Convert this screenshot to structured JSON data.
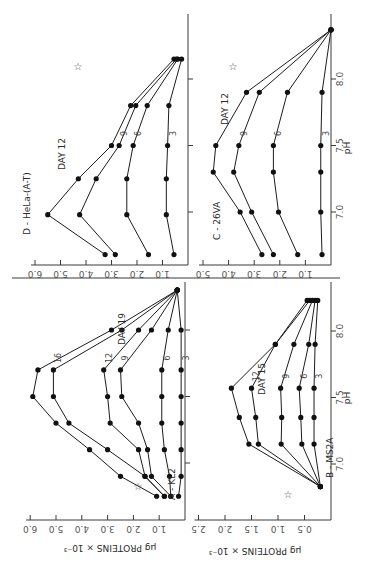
{
  "figure": {
    "orientation": "rotated 90 degrees clockwise",
    "xlabel": "pH",
    "ylabel": "µg PROTEINS × 10⁻³",
    "star_marker": "☆"
  },
  "chart_data": [
    {
      "type": "line",
      "panel": "A",
      "title": "A - KL2",
      "annotation": "DAY 19",
      "xlabel": "pH",
      "ylabel": "µg PROTEINS × 10⁻³",
      "xticks": [
        "7.0",
        "7.5",
        "8.0"
      ],
      "yticks": [
        "1.0",
        "2.0",
        "3.0",
        "4.0",
        "5.0",
        "6.0"
      ],
      "ylim": [
        0,
        6.0
      ],
      "series": [
        {
          "name": "19",
          "x": [
            6.75,
            6.9,
            7.1,
            7.3,
            7.5,
            7.7,
            8.0,
            8.3
          ],
          "values": [
            1.1,
            2.5,
            3.7,
            5.0,
            5.9,
            5.7,
            2.85,
            0.3
          ]
        },
        {
          "name": "16",
          "x": [
            6.75,
            6.9,
            7.1,
            7.3,
            7.5,
            7.7,
            8.0,
            8.3
          ],
          "values": [
            0.8,
            1.55,
            3.0,
            4.5,
            5.1,
            5.1,
            2.45,
            0.3
          ]
        },
        {
          "name": "12",
          "x": [
            6.75,
            6.9,
            7.1,
            7.3,
            7.5,
            7.7,
            8.0,
            8.3
          ],
          "values": [
            0.8,
            1.55,
            1.8,
            2.9,
            3.0,
            3.15,
            1.8,
            0.3
          ]
        },
        {
          "name": "9",
          "x": [
            6.75,
            6.9,
            7.1,
            7.3,
            7.5,
            7.7,
            8.0,
            8.3
          ],
          "values": [
            0.55,
            1.3,
            1.45,
            1.8,
            2.45,
            2.5,
            1.3,
            0.3
          ]
        },
        {
          "name": "6",
          "x": [
            6.75,
            6.9,
            7.1,
            7.3,
            7.5,
            7.7,
            8.0,
            8.3
          ],
          "values": [
            0.55,
            0.6,
            0.8,
            0.9,
            0.9,
            0.9,
            0.65,
            0.3
          ]
        },
        {
          "name": "3",
          "x": [
            6.75,
            6.9,
            7.1,
            7.3,
            7.5,
            7.7,
            8.0,
            8.3
          ],
          "values": [
            0.25,
            0.15,
            0.15,
            0.15,
            0.15,
            0.15,
            0.15,
            0.3
          ]
        }
      ]
    },
    {
      "type": "line",
      "panel": "B",
      "title": "B - MS2A",
      "annotation": "DAY 15",
      "xlabel": "pH",
      "ylabel": "µg PROTEINS × 10⁻³",
      "xticks": [
        "7.0",
        "7.5",
        "8.0"
      ],
      "yticks": [
        "0.5",
        "1.0",
        "1.5",
        "2.0",
        "2.5"
      ],
      "ylim": [
        0,
        2.5
      ],
      "series": [
        {
          "name": "15",
          "x": [
            6.83,
            7.15,
            7.35,
            7.57,
            7.9,
            8.23
          ],
          "values": [
            0.2,
            1.55,
            1.73,
            1.88,
            1.05,
            0.45
          ]
        },
        {
          "name": "12",
          "x": [
            6.83,
            7.15,
            7.35,
            7.57,
            7.9,
            8.23
          ],
          "values": [
            0.2,
            1.37,
            1.42,
            1.5,
            1.05,
            0.4
          ]
        },
        {
          "name": "9",
          "x": [
            6.83,
            7.15,
            7.35,
            7.57,
            7.9,
            8.23
          ],
          "values": [
            0.2,
            0.94,
            0.93,
            0.95,
            0.7,
            0.35
          ]
        },
        {
          "name": "6",
          "x": [
            6.83,
            7.15,
            7.35,
            7.57,
            7.9,
            8.23
          ],
          "values": [
            0.2,
            0.55,
            0.57,
            0.6,
            0.42,
            0.3
          ]
        },
        {
          "name": "3",
          "x": [
            6.83,
            7.15,
            7.35,
            7.57,
            7.9,
            8.23
          ],
          "values": [
            0.2,
            0.32,
            0.32,
            0.32,
            0.3,
            0.25
          ]
        }
      ]
    },
    {
      "type": "line",
      "panel": "C",
      "title": "C - 26VA",
      "annotation": "DAY 12",
      "xlabel": "pH",
      "ylabel": "µg PROTEINS × 10⁻³",
      "xticks": [
        "7.0",
        "7.5",
        "8.0"
      ],
      "yticks": [
        "1.0",
        "2.0",
        "3.0",
        "4.0",
        "5.0"
      ],
      "ylim": [
        0,
        5.0
      ],
      "series": [
        {
          "name": "12",
          "x": [
            6.68,
            7.0,
            7.3,
            7.5,
            7.9,
            8.37
          ],
          "values": [
            2.7,
            3.55,
            4.6,
            4.5,
            3.3,
            0.0
          ]
        },
        {
          "name": "9",
          "x": [
            6.68,
            7.0,
            7.3,
            7.5,
            7.9,
            8.37
          ],
          "values": [
            2.25,
            3.1,
            3.8,
            3.6,
            2.8,
            0.0
          ]
        },
        {
          "name": "6",
          "x": [
            6.68,
            7.0,
            7.3,
            7.5,
            7.9,
            8.37
          ],
          "values": [
            1.3,
            2.05,
            2.25,
            2.25,
            1.7,
            0.0
          ]
        },
        {
          "name": "3",
          "x": [
            6.68,
            7.0,
            7.3,
            7.5,
            7.9,
            8.37
          ],
          "values": [
            0.35,
            0.4,
            0.4,
            0.4,
            0.35,
            0.0
          ]
        }
      ]
    },
    {
      "type": "line",
      "panel": "D",
      "title": "D - HeLa-(A-T)",
      "annotation": "DAY 12",
      "xlabel": "pH",
      "ylabel": "µg PROTEINS × 10⁻³",
      "xticks": [
        "7.0",
        "7.5",
        "8.0"
      ],
      "yticks": [
        "1.0",
        "2.0",
        "3.0",
        "4.0",
        "5.0",
        "6.0"
      ],
      "ylim": [
        0,
        6.0
      ],
      "series": [
        {
          "name": "12",
          "x": [
            6.68,
            6.98,
            7.25,
            7.5,
            7.8,
            8.15
          ],
          "values": [
            3.25,
            5.5,
            4.3,
            3.0,
            2.25,
            0.55
          ]
        },
        {
          "name": "9",
          "x": [
            6.68,
            6.98,
            7.25,
            7.5,
            7.8,
            8.15
          ],
          "values": [
            2.85,
            4.25,
            3.6,
            2.7,
            2.05,
            0.45
          ]
        },
        {
          "name": "6",
          "x": [
            6.68,
            6.98,
            7.25,
            7.5,
            7.8,
            8.15
          ],
          "values": [
            1.55,
            2.4,
            2.4,
            2.15,
            1.6,
            0.4
          ]
        },
        {
          "name": "3",
          "x": [
            6.68,
            6.98,
            7.25,
            7.5,
            7.8,
            8.15
          ],
          "values": [
            0.55,
            0.85,
            0.85,
            0.8,
            0.75,
            0.25
          ]
        }
      ]
    }
  ],
  "layout": {
    "panels": {
      "A": {
        "zero_x": 185,
        "px_per_unit": 25.8,
        "ph7_y": 463,
        "px_per_ph": 133,
        "axis_top": 282,
        "axis_bottom": 520,
        "val_axis_y": 520,
        "title_pos": [
          175,
          500
        ],
        "day_pos": [
          125,
          345
        ],
        "star_pos": [
          138,
          490
        ],
        "label_at": 7.7
      },
      "B": {
        "zero_x": 331,
        "px_per_unit": 53,
        "ph7_y": 464,
        "px_per_ph": 133,
        "axis_top": 282,
        "axis_bottom": 520,
        "val_axis_y": 520,
        "title_pos": [
          333,
          478
        ],
        "day_pos": [
          265,
          395
        ],
        "star_pos": [
          288,
          498
        ],
        "label_at": 7.57
      },
      "C": {
        "zero_x": 331,
        "px_per_unit": 25.6,
        "ph7_y": 212,
        "px_per_ph": 133,
        "axis_top": 14,
        "axis_bottom": 265,
        "val_axis_y": 265,
        "title_pos": [
          220,
          240
        ],
        "day_pos": [
          228,
          125
        ],
        "star_pos": [
          233,
          70
        ],
        "label_at": 7.65
      },
      "D": {
        "zero_x": 188,
        "px_per_unit": 25.5,
        "ph7_y": 212,
        "px_per_ph": 133,
        "axis_top": 14,
        "axis_bottom": 265,
        "val_axis_y": 265,
        "title_pos": [
          30,
          235
        ],
        "day_pos": [
          65,
          170
        ],
        "star_pos": [
          78,
          70
        ],
        "label_at": 7.38
      }
    }
  }
}
